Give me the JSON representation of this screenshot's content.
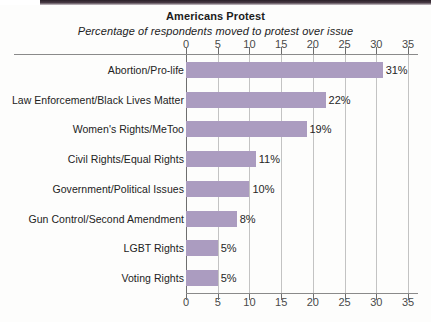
{
  "chart_data": {
    "type": "bar",
    "orientation": "horizontal",
    "title": "Americans Protest",
    "subtitle": "Percentage of respondents moved to protest over issue",
    "xlabel": "",
    "ylabel": "",
    "xlim": [
      0,
      35
    ],
    "xticks": [
      0,
      5,
      10,
      15,
      20,
      25,
      30,
      35
    ],
    "xtick_labels": [
      "0",
      "5",
      "10",
      "15",
      "20",
      "25",
      "30",
      "35"
    ],
    "grid": "vertical",
    "legend": "none",
    "axis_positions": [
      "top",
      "bottom"
    ],
    "bar_color": "#ab9cc0",
    "value_suffix": "%",
    "categories": [
      "Abortion/Pro-life",
      "Law Enforcement/Black Lives Matter",
      "Women's Rights/MeToo",
      "Civil Rights/Equal Rights",
      "Government/Political Issues",
      "Gun Control/Second Amendment",
      "LGBT Rights",
      "Voting Rights"
    ],
    "values": [
      31,
      22,
      19,
      11,
      10,
      8,
      5,
      5
    ],
    "data_labels": [
      "31%",
      "22%",
      "19%",
      "11%",
      "10%",
      "8%",
      "5%",
      "5%"
    ]
  }
}
